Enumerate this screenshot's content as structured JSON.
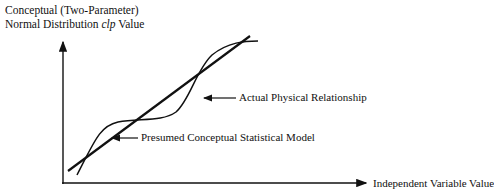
{
  "diagram": {
    "y_axis_label_line1": "Conceptual (Two-Parameter)",
    "y_axis_label_line2_pre": "Normal Distribution ",
    "y_axis_label_line2_italic": "clp",
    "y_axis_label_line2_post": " Value",
    "x_axis_label": "Independent Variable Value",
    "annotations": {
      "actual": "Actual Physical Relationship",
      "presumed": "Presumed Conceptual Statistical Model"
    },
    "line_color": "#111111"
  }
}
